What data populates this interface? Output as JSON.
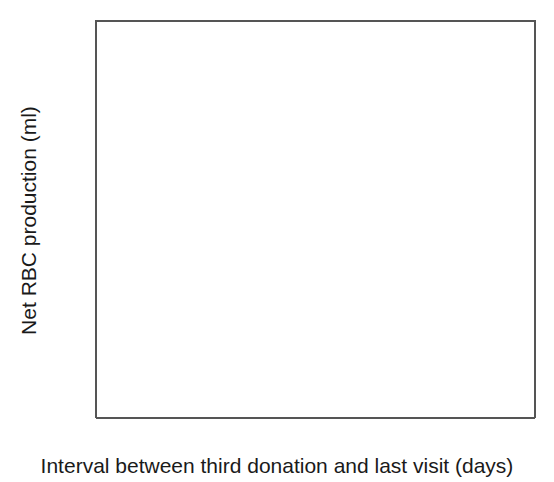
{
  "chart_data": {
    "type": "scatter",
    "title": "",
    "xlabel": "Interval between third donation and last visit (days)",
    "ylabel": "Net RBC production (ml)",
    "xlim": [
      0,
      40
    ],
    "ylim": [
      0,
      1200
    ],
    "xticks": [
      0,
      10,
      20,
      30,
      40
    ],
    "yticks": [
      0,
      200,
      400,
      600,
      800,
      1000,
      1200
    ],
    "xtick_labels": [
      "0",
      "10",
      "20",
      "30",
      "40"
    ],
    "ytick_labels": [
      "0",
      "200",
      "400",
      "600",
      "800",
      "1000",
      "1200"
    ],
    "grid": false,
    "legend": null,
    "marker": "open-circle",
    "marker_color": "#222222",
    "marker_size": 7,
    "points": [
      [
        4.0,
        300
      ],
      [
        4.3,
        288
      ],
      [
        5.6,
        697
      ],
      [
        6.0,
        615
      ],
      [
        5.7,
        330
      ],
      [
        5.9,
        300
      ],
      [
        5.6,
        270
      ],
      [
        6.4,
        440
      ],
      [
        6.5,
        345
      ],
      [
        6.6,
        325
      ],
      [
        6.5,
        300
      ],
      [
        6.5,
        278
      ],
      [
        7.0,
        358
      ],
      [
        7.0,
        332
      ],
      [
        7.0,
        312
      ],
      [
        7.4,
        360
      ],
      [
        7.5,
        335
      ],
      [
        7.2,
        262
      ],
      [
        7.6,
        240
      ],
      [
        7.9,
        190
      ],
      [
        7.9,
        168
      ],
      [
        7.9,
        148
      ],
      [
        7.9,
        128
      ],
      [
        8.0,
        5
      ],
      [
        8.6,
        230
      ],
      [
        8.9,
        300
      ],
      [
        9.6,
        175
      ],
      [
        10.1,
        205
      ],
      [
        10.4,
        152
      ],
      [
        11.2,
        148
      ],
      [
        9.9,
        300
      ],
      [
        10.6,
        305
      ],
      [
        11.9,
        270
      ],
      [
        12.4,
        238
      ],
      [
        12.6,
        520
      ],
      [
        13.0,
        472
      ],
      [
        13.2,
        443
      ],
      [
        13.1,
        720
      ],
      [
        13.6,
        497
      ],
      [
        13.7,
        470
      ],
      [
        13.8,
        440
      ],
      [
        13.8,
        413
      ],
      [
        13.5,
        355
      ],
      [
        14.0,
        352
      ],
      [
        14.1,
        330
      ],
      [
        13.4,
        300
      ],
      [
        14.4,
        292
      ],
      [
        13.2,
        225
      ],
      [
        14.2,
        222
      ],
      [
        13.8,
        150
      ],
      [
        14.4,
        142
      ],
      [
        14.0,
        35
      ],
      [
        15.5,
        455
      ],
      [
        15.6,
        390
      ],
      [
        15.9,
        342
      ],
      [
        16.0,
        318
      ],
      [
        15.8,
        225
      ],
      [
        16.6,
        230
      ],
      [
        16.2,
        745
      ],
      [
        17.3,
        640
      ],
      [
        17.9,
        400
      ],
      [
        18.0,
        372
      ],
      [
        17.6,
        290
      ],
      [
        18.9,
        455
      ],
      [
        19.4,
        448
      ],
      [
        19.8,
        438
      ],
      [
        19.1,
        392
      ],
      [
        19.6,
        378
      ],
      [
        18.7,
        250
      ],
      [
        19.3,
        235
      ],
      [
        20.6,
        480
      ],
      [
        21.2,
        465
      ],
      [
        20.8,
        382
      ],
      [
        21.5,
        1010
      ],
      [
        22.0,
        330
      ],
      [
        22.4,
        310
      ],
      [
        21.8,
        232
      ],
      [
        22.5,
        228
      ],
      [
        23.3,
        662
      ],
      [
        23.8,
        480
      ],
      [
        24.3,
        490
      ],
      [
        24.2,
        300
      ],
      [
        24.6,
        282
      ],
      [
        24.0,
        228
      ],
      [
        24.5,
        222
      ],
      [
        25.6,
        670
      ],
      [
        26.2,
        648
      ],
      [
        25.9,
        625
      ],
      [
        26.4,
        420
      ],
      [
        26.4,
        390
      ],
      [
        26.9,
        432
      ],
      [
        27.4,
        300
      ],
      [
        28.2,
        435
      ],
      [
        29.0,
        555
      ],
      [
        29.4,
        535
      ],
      [
        30.6,
        695
      ],
      [
        30.8,
        445
      ],
      [
        32.9,
        710
      ]
    ],
    "trendline": {
      "type": "linear",
      "x_start": 0,
      "y_start": 160,
      "x_end": 40,
      "y_end": 720,
      "color": "#000000",
      "width": 4
    }
  },
  "axes": {
    "y_tick_labels": [
      "1200",
      "1000",
      "800",
      "600",
      "400",
      "200",
      "0"
    ],
    "x_tick_labels": [
      "0",
      "10",
      "20",
      "30",
      "40"
    ],
    "y_title": "Net RBC production (ml)",
    "x_title": "Interval between third donation and last visit (days)"
  }
}
